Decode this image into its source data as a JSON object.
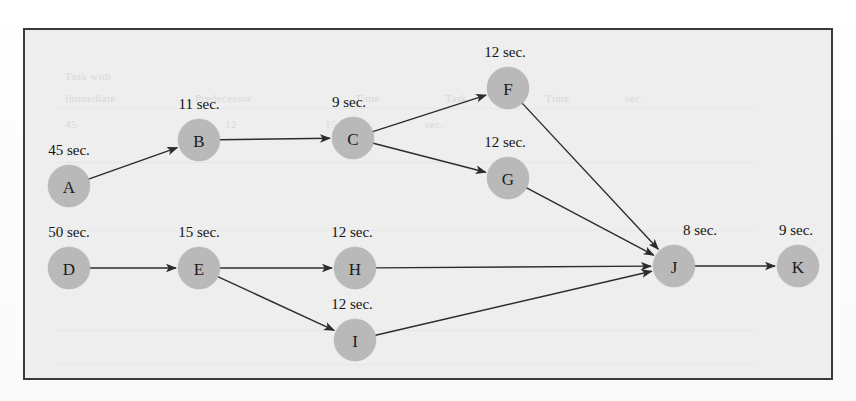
{
  "diagram": {
    "type": "directed-task-precedence-graph",
    "frame": {
      "x": 23,
      "y": 28,
      "width": 810,
      "height": 352,
      "fill": "#eeeeee",
      "border_color": "#3b3b3f"
    },
    "node_style": {
      "radius": 21,
      "fill": "#b9b9b9",
      "label_color": "#1b1b1b"
    },
    "edge_style": {
      "color": "#2c2c2c",
      "width": 1.4,
      "arrowhead": "filled-triangle"
    },
    "nodes": [
      {
        "id": "A",
        "label": "A",
        "duration": "45 sec.",
        "cx": 69,
        "cy": 186,
        "lx": 69,
        "ly": 155
      },
      {
        "id": "B",
        "label": "B",
        "duration": "11 sec.",
        "cx": 199,
        "cy": 140,
        "lx": 199,
        "ly": 109
      },
      {
        "id": "C",
        "label": "C",
        "duration": "9 sec.",
        "cx": 353,
        "cy": 138,
        "lx": 349,
        "ly": 107
      },
      {
        "id": "F",
        "label": "F",
        "duration": "12 sec.",
        "cx": 508,
        "cy": 88,
        "lx": 505,
        "ly": 57
      },
      {
        "id": "G",
        "label": "G",
        "duration": "12 sec.",
        "cx": 508,
        "cy": 178,
        "lx": 505,
        "ly": 147
      },
      {
        "id": "D",
        "label": "D",
        "duration": "50 sec.",
        "cx": 69,
        "cy": 268,
        "lx": 69,
        "ly": 237
      },
      {
        "id": "E",
        "label": "E",
        "duration": "15 sec.",
        "cx": 199,
        "cy": 268,
        "lx": 199,
        "ly": 237
      },
      {
        "id": "H",
        "label": "H",
        "duration": "12 sec.",
        "cx": 355,
        "cy": 268,
        "lx": 352,
        "ly": 237
      },
      {
        "id": "I",
        "label": "I",
        "duration": "12 sec.",
        "cx": 355,
        "cy": 340,
        "lx": 352,
        "ly": 309
      },
      {
        "id": "J",
        "label": "J",
        "duration": "8 sec.",
        "cx": 674,
        "cy": 266,
        "lx": 700,
        "ly": 235
      },
      {
        "id": "K",
        "label": "K",
        "duration": "9 sec.",
        "cx": 798,
        "cy": 266,
        "lx": 796,
        "ly": 235
      }
    ],
    "edges": [
      {
        "from": "A",
        "to": "B"
      },
      {
        "from": "B",
        "to": "C"
      },
      {
        "from": "C",
        "to": "F"
      },
      {
        "from": "C",
        "to": "G"
      },
      {
        "from": "F",
        "to": "J"
      },
      {
        "from": "G",
        "to": "J"
      },
      {
        "from": "D",
        "to": "E"
      },
      {
        "from": "E",
        "to": "H"
      },
      {
        "from": "E",
        "to": "I"
      },
      {
        "from": "H",
        "to": "J"
      },
      {
        "from": "I",
        "to": "J"
      },
      {
        "from": "J",
        "to": "K"
      }
    ]
  },
  "background_ghost_text": [
    {
      "text": "Task with",
      "x": 40,
      "y": 40
    },
    {
      "text": "Immediate",
      "x": 40,
      "y": 62
    },
    {
      "text": "Predecessor",
      "x": 170,
      "y": 62
    },
    {
      "text": "Time",
      "x": 330,
      "y": 62
    },
    {
      "text": "Task",
      "x": 420,
      "y": 62
    },
    {
      "text": "Time",
      "x": 520,
      "y": 62
    },
    {
      "text": "sec.",
      "x": 600,
      "y": 62
    },
    {
      "text": "45",
      "x": 40,
      "y": 88
    },
    {
      "text": "12",
      "x": 200,
      "y": 88
    },
    {
      "text": "15",
      "x": 300,
      "y": 88
    },
    {
      "text": "sec.",
      "x": 400,
      "y": 88
    },
    {
      "text": "11",
      "x": 40,
      "y": 116
    },
    {
      "text": "100",
      "x": 45,
      "y": 142
    }
  ]
}
